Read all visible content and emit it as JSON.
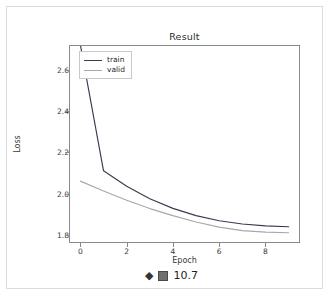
{
  "figure": {
    "title": "Result",
    "xlabel": "Epoch",
    "ylabel": "Loss"
  },
  "legend": {
    "entries": [
      {
        "label": "train",
        "color": "#3b3b4f"
      },
      {
        "label": "valid",
        "color": "#a8a8a8"
      }
    ]
  },
  "caption": {
    "diamond_icon": "◆",
    "box_glyph_icon": "tofu-box-icon",
    "number": "10.7"
  },
  "chart_data": {
    "type": "line",
    "title": "Result",
    "xlabel": "Epoch",
    "ylabel": "Loss",
    "x": [
      0,
      1,
      2,
      3,
      4,
      5,
      6,
      7,
      8,
      9
    ],
    "xlim": [
      -0.45,
      9.45
    ],
    "ylim": [
      1.765,
      2.715
    ],
    "xticks": [
      0,
      2,
      4,
      6,
      8
    ],
    "xtick_labels": [
      "0",
      "2",
      "4",
      "6",
      "8"
    ],
    "yticks": [
      1.8,
      2.0,
      2.2,
      2.4,
      2.6
    ],
    "ytick_labels": [
      "1.8",
      "2.0",
      "2.2",
      "2.4",
      "2.6"
    ],
    "grid": false,
    "legend_position": "upper left",
    "series": [
      {
        "name": "train",
        "color": "#3b3b4f",
        "values": [
          2.72,
          2.11,
          2.035,
          1.975,
          1.928,
          1.893,
          1.868,
          1.852,
          1.843,
          1.839
        ]
      },
      {
        "name": "valid",
        "color": "#a8a8a8",
        "values": [
          2.06,
          2.012,
          1.967,
          1.927,
          1.893,
          1.862,
          1.837,
          1.82,
          1.813,
          1.81
        ]
      }
    ]
  }
}
